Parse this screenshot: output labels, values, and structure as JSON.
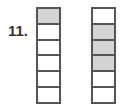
{
  "problem": {
    "number_label": "11."
  },
  "colors": {
    "shaded": "#d3d3d3",
    "unshaded": "#ffffff",
    "border": "#555555"
  },
  "bars": [
    {
      "name": "left-fraction-bar",
      "total_cells": 6,
      "shaded_cells": 1,
      "cells": [
        true,
        false,
        false,
        false,
        false,
        false
      ]
    },
    {
      "name": "right-fraction-bar",
      "total_cells": 6,
      "shaded_cells": 3,
      "cells": [
        false,
        true,
        true,
        true,
        false,
        false
      ]
    }
  ]
}
